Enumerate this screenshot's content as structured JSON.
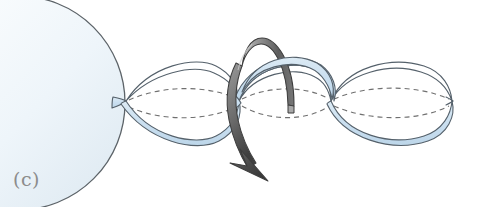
{
  "figure": {
    "panel_label": "(c)",
    "caption_text": "(c)",
    "background_color": "#ffffff",
    "width": 483,
    "height": 207,
    "type": "scientific-schematic",
    "elements": {
      "sphere": {
        "name": "sphere-body",
        "description": "large pale sphere at left, mostly cropped by the left image edge",
        "fill_color": "#eef5f9",
        "stroke_color": "#5c6368",
        "center_x": 18,
        "center_y": 103,
        "radius": 107
      },
      "helix_ribbon_front": {
        "name": "helix-strand-front",
        "description": "front ribbon strand of the double helix",
        "fill_color": "#cfe1ee",
        "stroke_color": "#55616b",
        "stroke_width": 1.1
      },
      "helix_ribbon_back": {
        "name": "helix-strand-back",
        "description": "rear ribbon strand of the double helix, drawn unfilled white",
        "fill_color": "#ffffff",
        "stroke_color": "#55616b",
        "stroke_width": 1.1
      },
      "axis_dashed_lines": {
        "name": "helix-axis-dashed-lines",
        "description": "two dashed curves marking the hidden rear contour of the helix envelope",
        "stroke_color": "#6f6f6f",
        "dash_pattern": "5 4",
        "count": 2
      },
      "rotation_arrow": {
        "name": "rotation-arrow",
        "description": "thick 3D band arrow curving over and around the helix indicating spin direction, arrowhead pointing down-left",
        "fill_color_light": "#b6b6b6",
        "fill_color_dark": "#4c4c4c",
        "stroke_color": "#3d3d3d"
      },
      "helix_nodes": {
        "name": "helix-crossing-nodes",
        "description": "points where the two strands cross",
        "x_positions": [
          126,
          239,
          331,
          452
        ],
        "y_position": 101
      }
    }
  },
  "colors": {
    "ribbon_fill": "#cfe1ee",
    "ribbon_stroke": "#55616b",
    "sphere_fill": "#eef5f9",
    "sphere_stroke": "#5c6368",
    "arrow_dark": "#4c4c4c",
    "arrow_light": "#b6b6b6",
    "dashed_line": "#6f6f6f",
    "label_text": "#8c8c8c",
    "background": "#ffffff"
  }
}
